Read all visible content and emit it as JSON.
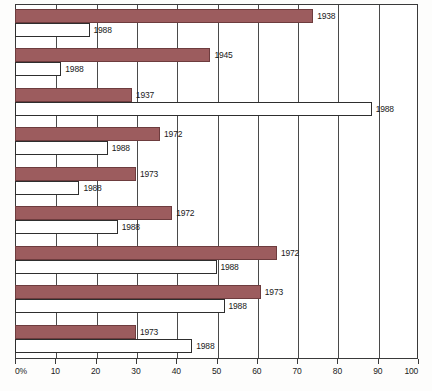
{
  "chart_data": {
    "type": "bar",
    "orientation": "horizontal",
    "title": "",
    "xlabel": "",
    "ylabel": "",
    "xlim": [
      0,
      100
    ],
    "xticks": [
      0,
      10,
      20,
      30,
      40,
      50,
      60,
      70,
      80,
      90,
      100
    ],
    "xtick_labels": [
      "0%",
      "10",
      "20",
      "30",
      "40",
      "50",
      "60",
      "70",
      "80",
      "90",
      "100"
    ],
    "grid": true,
    "legend": "none",
    "colors": {
      "historical_bar": "#9c5c5e",
      "historical_border": "#6d3c3e",
      "current_bar": "#ffffff",
      "current_border": "#2e2e2e",
      "gridline": "#4a4a4a",
      "frame": "#3a3a3a",
      "text": "#1a1a1a"
    },
    "groups": [
      {
        "bars": [
          {
            "label": "1938",
            "value": 74.0,
            "style": "historical"
          },
          {
            "label": "1988",
            "value": 18.5,
            "style": "current"
          }
        ]
      },
      {
        "bars": [
          {
            "label": "1945",
            "value": 48.5,
            "style": "historical"
          },
          {
            "label": "1988",
            "value": 11.5,
            "style": "current"
          }
        ]
      },
      {
        "bars": [
          {
            "label": "1937",
            "value": 29.0,
            "style": "historical"
          },
          {
            "label": "1988",
            "value": 88.5,
            "style": "current"
          }
        ]
      },
      {
        "bars": [
          {
            "label": "1972",
            "value": 36.0,
            "style": "historical"
          },
          {
            "label": "1988",
            "value": 23.0,
            "style": "current"
          }
        ]
      },
      {
        "bars": [
          {
            "label": "1973",
            "value": 30.0,
            "style": "historical"
          },
          {
            "label": "1988",
            "value": 16.0,
            "style": "current"
          }
        ]
      },
      {
        "bars": [
          {
            "label": "1972",
            "value": 39.0,
            "style": "historical"
          },
          {
            "label": "1988",
            "value": 25.5,
            "style": "current"
          }
        ]
      },
      {
        "bars": [
          {
            "label": "1972",
            "value": 65.0,
            "style": "historical"
          },
          {
            "label": "1988",
            "value": 50.0,
            "style": "current"
          }
        ]
      },
      {
        "bars": [
          {
            "label": "1973",
            "value": 61.0,
            "style": "historical"
          },
          {
            "label": "1988",
            "value": 52.0,
            "style": "current"
          }
        ]
      },
      {
        "bars": [
          {
            "label": "1973",
            "value": 30.0,
            "style": "historical"
          },
          {
            "label": "1988",
            "value": 44.0,
            "style": "current"
          }
        ]
      }
    ]
  }
}
